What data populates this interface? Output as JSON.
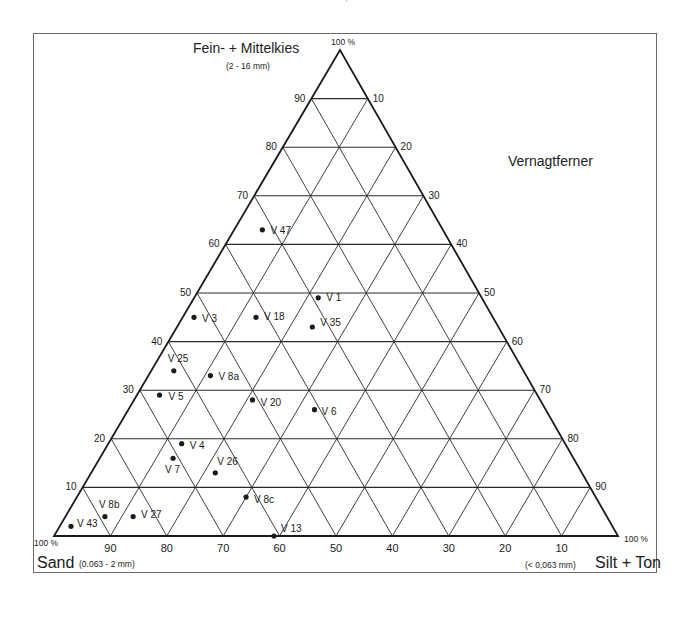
{
  "chart_data": {
    "type": "ternary-scatter",
    "title": "Vernagtferner",
    "axes": {
      "top": {
        "label": "Fein- + Mittelkies",
        "range_label": "(2 - 16 mm)",
        "corner_label": "100 %",
        "key": "kies"
      },
      "left": {
        "label": "Sand",
        "range_label": "(0.063 - 2 mm)",
        "corner_label": "100 %",
        "key": "sand"
      },
      "right": {
        "label": "Silt + Ton",
        "range_label": "(< 0,063 mm)",
        "corner_label": "100 %",
        "key": "silt_ton"
      }
    },
    "ticks": {
      "left_edge": [
        "10",
        "20",
        "30",
        "40",
        "50",
        "60",
        "70",
        "80",
        "90"
      ],
      "right_edge": [
        "10",
        "20",
        "30",
        "40",
        "50",
        "60",
        "70",
        "80",
        "90"
      ],
      "bottom_edge": [
        "90",
        "80",
        "70",
        "60",
        "50",
        "40",
        "30",
        "20",
        "10"
      ]
    },
    "grid": {
      "on": true,
      "step_percent": 10
    },
    "points": [
      {
        "name": "V 47",
        "kies": 63,
        "sand": 32,
        "silt_ton": 5,
        "label_dx": 8,
        "label_dy": -5
      },
      {
        "name": "V 1",
        "kies": 49,
        "sand": 29,
        "silt_ton": 22,
        "label_dx": 8,
        "label_dy": -6
      },
      {
        "name": "V 35",
        "kies": 43,
        "sand": 33,
        "silt_ton": 24,
        "label_dx": 8,
        "label_dy": -10
      },
      {
        "name": "V 18",
        "kies": 45,
        "sand": 42,
        "silt_ton": 13,
        "label_dx": 8,
        "label_dy": -6
      },
      {
        "name": "V 3",
        "kies": 45,
        "sand": 53,
        "silt_ton": 2,
        "label_dx": 8,
        "label_dy": -4
      },
      {
        "name": "V 25",
        "kies": 34,
        "sand": 62,
        "silt_ton": 4,
        "label_dx": -6,
        "label_dy": -18
      },
      {
        "name": "V 8a",
        "kies": 33,
        "sand": 56,
        "silt_ton": 11,
        "label_dx": 8,
        "label_dy": -5
      },
      {
        "name": "V 5",
        "kies": 29,
        "sand": 67,
        "silt_ton": 4,
        "label_dx": 9,
        "label_dy": -4
      },
      {
        "name": "V 20",
        "kies": 28,
        "sand": 51,
        "silt_ton": 21,
        "label_dx": 8,
        "label_dy": -3
      },
      {
        "name": "V 6",
        "kies": 26,
        "sand": 41,
        "silt_ton": 33,
        "label_dx": 7,
        "label_dy": -4
      },
      {
        "name": "V 4",
        "kies": 19,
        "sand": 68,
        "silt_ton": 13,
        "label_dx": 8,
        "label_dy": -4
      },
      {
        "name": "V 7",
        "kies": 16,
        "sand": 71,
        "silt_ton": 13,
        "label_dx": -8,
        "label_dy": 6
      },
      {
        "name": "V 26",
        "kies": 13,
        "sand": 65,
        "silt_ton": 22,
        "label_dx": 2,
        "label_dy": -17
      },
      {
        "name": "V 8c",
        "kies": 8,
        "sand": 62,
        "silt_ton": 30,
        "label_dx": 8,
        "label_dy": -3
      },
      {
        "name": "V 8b",
        "kies": 4,
        "sand": 89,
        "silt_ton": 7,
        "label_dx": -6,
        "label_dy": -18
      },
      {
        "name": "V 27",
        "kies": 4,
        "sand": 84,
        "silt_ton": 12,
        "label_dx": 8,
        "label_dy": -8
      },
      {
        "name": "V 43",
        "kies": 2,
        "sand": 96,
        "silt_ton": 2,
        "label_dx": 6,
        "label_dy": -8
      },
      {
        "name": "V 13",
        "kies": 0,
        "sand": 61,
        "silt_ton": 39,
        "label_dx": 7,
        "label_dy": -13
      }
    ]
  },
  "labels": {
    "top_title": "Fein- + Mittelkies",
    "top_sub": "(2 - 16 mm)",
    "top_corner": "100 %",
    "region_title": "Vernagtferner",
    "left_corner": "100 %",
    "left_title": "Sand",
    "left_sub": "(0.063 - 2 mm)",
    "right_corner": "100 %",
    "right_title": "Silt + Ton",
    "right_sub": "(< 0,063 mm)"
  },
  "colors": {
    "ink": "#1a1a1a",
    "grid": "#2a2a2a",
    "frame": "#6a6a6a",
    "background": "#ffffff"
  }
}
